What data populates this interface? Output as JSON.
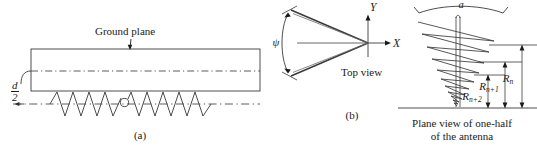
{
  "figure": {
    "panel_a": {
      "ground_plane_label": "Ground plane",
      "spacing_label_numerator": "d",
      "spacing_label_denominator": "2",
      "caption": "(a)"
    },
    "panel_b": {
      "angle_label": "ψ",
      "axis_x_label": "X",
      "axis_y_label": "Y",
      "top_view_label": "Top view",
      "caption": "(b)"
    },
    "panel_c": {
      "width_label": "a",
      "radius_labels": [
        "R",
        "R",
        "R"
      ],
      "radius_subscripts": [
        "n",
        "n+1",
        "n+2"
      ],
      "caption_line1": "Plane view of one-half",
      "caption_line2": "of the antenna"
    },
    "colors": {
      "ink": "#1a1a1a",
      "line": "#4a4a4a",
      "background": "#ffffff"
    }
  }
}
